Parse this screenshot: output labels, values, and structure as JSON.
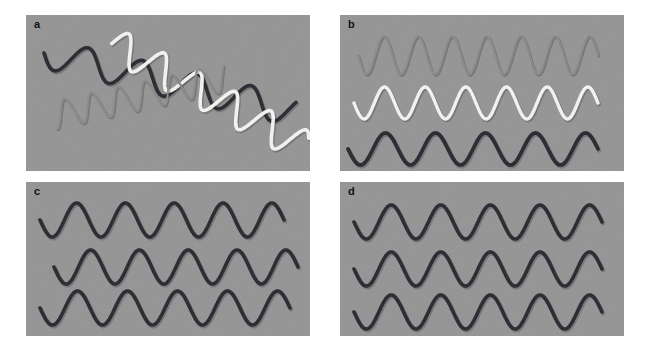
{
  "figure": {
    "background_color": "#ffffff",
    "panel_background_color": "#949494",
    "width": 650,
    "height": 350
  },
  "colors": {
    "panel_bg": "#949494",
    "dark_wave": "#26262e",
    "white_wave": "#f4f4f2",
    "gray_wave": "#8a8a8a",
    "gray_wave_shadow": "#6e6e6e",
    "label_text": "#121218",
    "page_bg": "#ffffff"
  },
  "panels": [
    {
      "id": "panel-a",
      "label": "a",
      "x": 26,
      "y": 15,
      "width": 284,
      "height": 156,
      "description": "Three diagonally oriented wavy traces overlapping: dark, white and faint gray",
      "waves": [
        {
          "name": "dark-diagonal-wave",
          "color": "#26262e",
          "stroke_width": 3.6,
          "cycles": 4.6,
          "amplitude": 15,
          "baseline_start_y": 38,
          "baseline_end_y": 96,
          "x_start": 18,
          "x_end": 268,
          "phase": 0.0
        },
        {
          "name": "white-diagonal-wave",
          "color": "#f4f4f2",
          "stroke_width": 3.6,
          "cycles": 5.4,
          "amplitude": 16,
          "baseline_start_y": 28,
          "baseline_end_y": 132,
          "x_start": 86,
          "x_end": 278,
          "phase": 3.1
        },
        {
          "name": "gray-faint-diagonal-wave",
          "color": "#8a8a8a",
          "stroke_width": 2.0,
          "cycles": 6.4,
          "amplitude": 14,
          "baseline_start_y": 100,
          "baseline_end_y": 62,
          "x_start": 28,
          "x_end": 200,
          "phase": 1.6
        }
      ]
    },
    {
      "id": "panel-b",
      "label": "b",
      "x": 340,
      "y": 15,
      "width": 284,
      "height": 156,
      "description": "Three horizontal waves of different spatial frequency: faint gray high-frequency, white medium, dark low",
      "waves": [
        {
          "name": "gray-high-frequency-wave",
          "color": "#8a8a8a",
          "stroke_width": 2.0,
          "cycles": 7.0,
          "amplitude": 19,
          "baseline_y": 40,
          "x_start": 18,
          "x_end": 258,
          "phase": 0.0
        },
        {
          "name": "white-medium-frequency-wave",
          "color": "#f4f4f2",
          "stroke_width": 3.4,
          "cycles": 6.0,
          "amplitude": 16,
          "baseline_y": 88,
          "x_start": 14,
          "x_end": 258,
          "phase": 0.0
        },
        {
          "name": "dark-low-frequency-wave",
          "color": "#26262e",
          "stroke_width": 3.8,
          "cycles": 5.0,
          "amplitude": 16,
          "baseline_y": 134,
          "x_start": 8,
          "x_end": 258,
          "phase": 0.0
        }
      ]
    },
    {
      "id": "panel-c",
      "label": "c",
      "x": 26,
      "y": 182,
      "width": 284,
      "height": 154,
      "description": "Three dark horizontal waves of equal frequency but offset phases",
      "waves": [
        {
          "name": "dark-wave-row-1",
          "color": "#26262e",
          "stroke_width": 3.6,
          "cycles": 5.0,
          "amplitude": 17,
          "baseline_y": 38,
          "x_start": 14,
          "x_end": 258,
          "phase": 0.0
        },
        {
          "name": "dark-wave-row-2",
          "color": "#26262e",
          "stroke_width": 3.6,
          "cycles": 5.0,
          "amplitude": 17,
          "baseline_y": 85,
          "x_start": 28,
          "x_end": 272,
          "phase": 0.0
        },
        {
          "name": "dark-wave-row-3",
          "color": "#26262e",
          "stroke_width": 3.6,
          "cycles": 5.0,
          "amplitude": 17,
          "baseline_y": 126,
          "x_start": 14,
          "x_end": 264,
          "phase": 0.0
        }
      ]
    },
    {
      "id": "panel-d",
      "label": "d",
      "x": 340,
      "y": 182,
      "width": 284,
      "height": 154,
      "description": "Three dark horizontal waves of equal frequency aligned in phase",
      "waves": [
        {
          "name": "dark-wave-row-1",
          "color": "#26262e",
          "stroke_width": 3.6,
          "cycles": 5.0,
          "amplitude": 17,
          "baseline_y": 40,
          "x_start": 14,
          "x_end": 262,
          "phase": 0.0
        },
        {
          "name": "dark-wave-row-2",
          "color": "#26262e",
          "stroke_width": 3.6,
          "cycles": 5.0,
          "amplitude": 17,
          "baseline_y": 87,
          "x_start": 14,
          "x_end": 262,
          "phase": 0.0
        },
        {
          "name": "dark-wave-row-3",
          "color": "#26262e",
          "stroke_width": 3.6,
          "cycles": 5.0,
          "amplitude": 17,
          "baseline_y": 130,
          "x_start": 14,
          "x_end": 262,
          "phase": 0.0
        }
      ]
    }
  ]
}
